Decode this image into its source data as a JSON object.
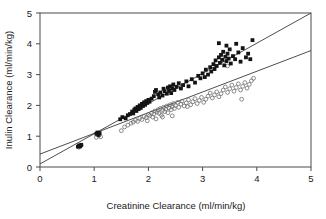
{
  "chart_data": {
    "type": "scatter",
    "title": "",
    "xlabel": "Creatinine Clearance (ml/min/kg)",
    "ylabel": "Inulin Clearance (ml/min/kg)",
    "xlim": [
      0,
      5
    ],
    "ylim": [
      0,
      5
    ],
    "xticks": [
      "0",
      "1",
      "2",
      "3",
      "4",
      "5"
    ],
    "yticks": [
      "0",
      "1",
      "2",
      "3",
      "4",
      "5"
    ],
    "xtick_values": [
      0,
      1,
      2,
      3,
      4,
      5
    ],
    "ytick_values": [
      0,
      1,
      2,
      3,
      4,
      5
    ],
    "grid": false,
    "legend": "none",
    "series": [
      {
        "name": "filled-squares",
        "marker": "filled-square",
        "color": "#141414",
        "points": [
          [
            0.7,
            0.66
          ],
          [
            0.72,
            0.7
          ],
          [
            0.74,
            0.67
          ],
          [
            0.76,
            0.72
          ],
          [
            1.04,
            1.08
          ],
          [
            1.06,
            1.12
          ],
          [
            1.08,
            1.04
          ],
          [
            1.1,
            1.1
          ],
          [
            1.48,
            1.55
          ],
          [
            1.52,
            1.62
          ],
          [
            1.58,
            1.58
          ],
          [
            1.62,
            1.68
          ],
          [
            1.66,
            1.72
          ],
          [
            1.7,
            1.8
          ],
          [
            1.72,
            1.74
          ],
          [
            1.74,
            1.86
          ],
          [
            1.76,
            1.9
          ],
          [
            1.78,
            1.82
          ],
          [
            1.8,
            1.95
          ],
          [
            1.82,
            1.88
          ],
          [
            1.84,
            2.0
          ],
          [
            1.86,
            1.92
          ],
          [
            1.88,
            2.05
          ],
          [
            1.9,
            1.98
          ],
          [
            1.92,
            2.1
          ],
          [
            1.94,
            2.02
          ],
          [
            1.96,
            2.14
          ],
          [
            1.98,
            2.08
          ],
          [
            2.0,
            2.18
          ],
          [
            2.02,
            2.12
          ],
          [
            2.06,
            2.22
          ],
          [
            2.1,
            2.3
          ],
          [
            2.12,
            2.44
          ],
          [
            2.14,
            2.5
          ],
          [
            2.18,
            2.36
          ],
          [
            2.2,
            2.26
          ],
          [
            2.22,
            2.42
          ],
          [
            2.26,
            2.32
          ],
          [
            2.28,
            2.54
          ],
          [
            2.3,
            2.46
          ],
          [
            2.34,
            2.38
          ],
          [
            2.36,
            2.58
          ],
          [
            2.38,
            2.48
          ],
          [
            2.4,
            2.62
          ],
          [
            2.42,
            2.4
          ],
          [
            2.44,
            2.56
          ],
          [
            2.46,
            2.68
          ],
          [
            2.48,
            2.5
          ],
          [
            2.52,
            2.6
          ],
          [
            2.56,
            2.72
          ],
          [
            2.6,
            2.55
          ],
          [
            2.64,
            2.66
          ],
          [
            2.7,
            2.78
          ],
          [
            2.74,
            2.62
          ],
          [
            2.8,
            2.85
          ],
          [
            2.86,
            2.74
          ],
          [
            2.92,
            2.96
          ],
          [
            2.96,
            2.88
          ],
          [
            3.0,
            3.04
          ],
          [
            3.04,
            2.92
          ],
          [
            3.06,
            3.16
          ],
          [
            3.1,
            3.0
          ],
          [
            3.14,
            3.24
          ],
          [
            3.16,
            3.1
          ],
          [
            3.2,
            3.34
          ],
          [
            3.22,
            3.18
          ],
          [
            3.24,
            3.46
          ],
          [
            3.26,
            3.28
          ],
          [
            3.3,
            3.56
          ],
          [
            3.32,
            3.38
          ],
          [
            3.34,
            3.64
          ],
          [
            3.36,
            3.48
          ],
          [
            3.38,
            3.74
          ],
          [
            3.4,
            3.3
          ],
          [
            3.42,
            3.58
          ],
          [
            3.44,
            3.44
          ],
          [
            3.46,
            3.68
          ],
          [
            3.48,
            3.52
          ],
          [
            3.5,
            3.82
          ],
          [
            3.52,
            3.36
          ],
          [
            3.56,
            3.6
          ],
          [
            3.6,
            3.5
          ],
          [
            3.66,
            3.72
          ],
          [
            3.7,
            3.42
          ],
          [
            3.74,
            3.86
          ],
          [
            3.8,
            3.56
          ],
          [
            3.84,
            3.68
          ],
          [
            3.88,
            3.5
          ],
          [
            3.92,
            4.12
          ],
          [
            3.3,
            4.02
          ],
          [
            3.44,
            3.94
          ],
          [
            3.62,
            4.0
          ]
        ]
      },
      {
        "name": "open-circles",
        "marker": "open-circle",
        "color": "#6e6e6e",
        "points": [
          [
            0.72,
            0.64
          ],
          [
            0.76,
            0.7
          ],
          [
            1.04,
            0.96
          ],
          [
            1.08,
            1.02
          ],
          [
            1.12,
            0.98
          ],
          [
            1.5,
            1.18
          ],
          [
            1.56,
            1.3
          ],
          [
            1.62,
            1.36
          ],
          [
            1.68,
            1.42
          ],
          [
            1.72,
            1.46
          ],
          [
            1.76,
            1.52
          ],
          [
            1.8,
            1.48
          ],
          [
            1.84,
            1.58
          ],
          [
            1.88,
            1.54
          ],
          [
            1.92,
            1.64
          ],
          [
            1.96,
            1.6
          ],
          [
            2.0,
            1.7
          ],
          [
            2.02,
            1.66
          ],
          [
            2.06,
            1.76
          ],
          [
            2.1,
            1.72
          ],
          [
            2.12,
            1.82
          ],
          [
            2.14,
            1.56
          ],
          [
            2.16,
            1.78
          ],
          [
            2.18,
            1.86
          ],
          [
            2.2,
            1.74
          ],
          [
            2.22,
            1.9
          ],
          [
            2.24,
            1.68
          ],
          [
            2.26,
            1.84
          ],
          [
            2.28,
            1.94
          ],
          [
            2.3,
            1.8
          ],
          [
            2.32,
            1.88
          ],
          [
            2.34,
            1.98
          ],
          [
            2.36,
            1.76
          ],
          [
            2.38,
            1.92
          ],
          [
            2.4,
            2.02
          ],
          [
            2.42,
            1.86
          ],
          [
            2.44,
            1.96
          ],
          [
            2.46,
            2.06
          ],
          [
            2.48,
            1.9
          ],
          [
            2.5,
            2.0
          ],
          [
            2.54,
            2.1
          ],
          [
            2.56,
            1.94
          ],
          [
            2.6,
            2.04
          ],
          [
            2.62,
            2.14
          ],
          [
            2.66,
            1.98
          ],
          [
            2.7,
            2.08
          ],
          [
            2.74,
            2.18
          ],
          [
            2.78,
            2.02
          ],
          [
            2.82,
            2.12
          ],
          [
            2.86,
            2.22
          ],
          [
            2.9,
            2.06
          ],
          [
            2.94,
            2.16
          ],
          [
            2.98,
            2.26
          ],
          [
            3.02,
            2.1
          ],
          [
            3.06,
            2.2
          ],
          [
            3.1,
            2.3
          ],
          [
            3.14,
            2.4
          ],
          [
            3.18,
            2.24
          ],
          [
            3.22,
            2.34
          ],
          [
            3.26,
            2.44
          ],
          [
            3.3,
            2.28
          ],
          [
            3.34,
            2.38
          ],
          [
            3.38,
            2.5
          ],
          [
            3.42,
            2.6
          ],
          [
            3.46,
            2.42
          ],
          [
            3.5,
            2.54
          ],
          [
            3.54,
            2.66
          ],
          [
            3.58,
            2.46
          ],
          [
            3.62,
            2.58
          ],
          [
            3.66,
            2.7
          ],
          [
            3.7,
            2.5
          ],
          [
            3.74,
            2.62
          ],
          [
            3.78,
            2.74
          ],
          [
            3.82,
            2.56
          ],
          [
            3.86,
            2.68
          ],
          [
            3.9,
            2.8
          ],
          [
            3.94,
            2.88
          ],
          [
            3.72,
            2.2
          ],
          [
            3.46,
            3.28
          ],
          [
            2.26,
            1.62
          ],
          [
            2.08,
            1.62
          ],
          [
            1.98,
            1.5
          ],
          [
            2.44,
            1.66
          ],
          [
            2.72,
            1.96
          ]
        ]
      }
    ],
    "fit_lines": [
      {
        "name": "upper-regression-line",
        "x0": 0,
        "y0": 0.1,
        "x1": 5,
        "y1": 5.0
      },
      {
        "name": "lower-regression-line",
        "x0": 0,
        "y0": 0.42,
        "x1": 5,
        "y1": 3.78
      }
    ]
  }
}
